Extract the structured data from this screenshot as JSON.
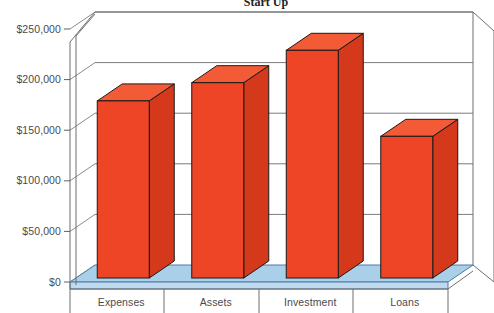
{
  "chart_data": {
    "type": "bar",
    "title": "Start Up",
    "xlabel": "",
    "ylabel": "",
    "categories": [
      "Expenses",
      "Assets",
      "Investment",
      "Loans"
    ],
    "values": [
      175000,
      193000,
      225000,
      140000
    ],
    "ytick_labels": [
      "$0",
      "$50,000",
      "$100,000",
      "$150,000",
      "$200,000",
      "$250,000"
    ],
    "ytick_values": [
      0,
      50000,
      100000,
      150000,
      200000,
      250000
    ],
    "ylim": [
      0,
      250000
    ],
    "grid": true,
    "legend": "none",
    "style": "3d-column",
    "colors": {
      "bar_front": "#ee4527",
      "bar_side": "#d4391c",
      "bar_top": "#f35b36",
      "bar_outline": "#1a1a1a",
      "floor": "#a9cfe9",
      "floor_edge": "#5b7fa6",
      "wall": "#ffffff",
      "gridline": "#7b7b7b",
      "axis": "#6e6e6e",
      "text": "#4b4b4b"
    }
  },
  "axis": {
    "y_ticks": [
      {
        "label": "$250,000",
        "value": 250000
      },
      {
        "label": "$200,000",
        "value": 200000
      },
      {
        "label": "$150,000",
        "value": 150000
      },
      {
        "label": "$100,000",
        "value": 100000
      },
      {
        "label": "$50,000",
        "value": 50000
      },
      {
        "label": "$0",
        "value": 0
      }
    ],
    "x_ticks": [
      "Expenses",
      "Assets",
      "Investment",
      "Loans"
    ]
  }
}
